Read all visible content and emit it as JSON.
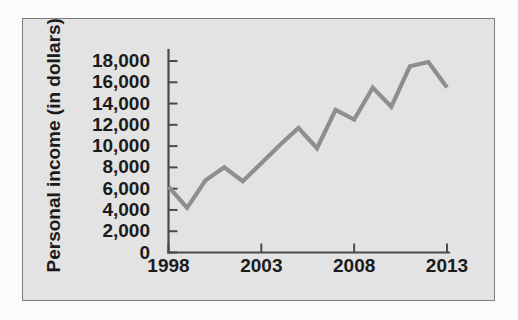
{
  "chart_data": {
    "type": "line",
    "title": "",
    "xlabel": "",
    "ylabel": "Personal income (in dollars)",
    "grid": false,
    "legend": "none",
    "xlim": [
      1998,
      2013
    ],
    "ylim": [
      0,
      18000
    ],
    "x_tick_labels": [
      "1998",
      "2003",
      "2008",
      "2013"
    ],
    "x_tick_values": [
      1998,
      2003,
      2008,
      2013
    ],
    "y_tick_labels": [
      "18,000",
      "16,000",
      "14,000",
      "12,000",
      "10,000",
      "8,000",
      "6,000",
      "4,000",
      "2,000",
      "0"
    ],
    "y_tick_values": [
      18000,
      16000,
      14000,
      12000,
      10000,
      8000,
      6000,
      4000,
      2000,
      0
    ],
    "series": [
      {
        "name": "Personal income",
        "color": "#8e8e8e",
        "x": [
          1998,
          1999,
          2000,
          2001,
          2002,
          2003,
          2004,
          2005,
          2006,
          2007,
          2008,
          2009,
          2010,
          2011,
          2012,
          2013
        ],
        "values": [
          6200,
          4200,
          6800,
          8000,
          6700,
          8400,
          10100,
          11700,
          9800,
          13400,
          12500,
          15500,
          13700,
          17500,
          17900,
          15500
        ]
      }
    ]
  },
  "axis_style": {
    "axis_color": "#4a4a4a",
    "panel_background": "#e3e3e3",
    "panel_border": "#7d7d7d",
    "page_background": "#fbfbfb"
  }
}
